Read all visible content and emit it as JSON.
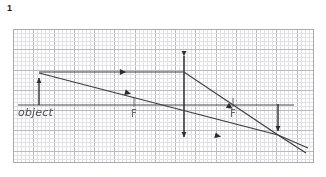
{
  "page": {
    "question_number": "1",
    "background_color": "#ffffff"
  },
  "grid": {
    "minor_cell_px": 4.05,
    "major_every": 5,
    "minor_color": "#e2e2e6",
    "major_color": "#b9b9bf",
    "border_color": "#a9a9b0",
    "origin_x": 13,
    "origin_y": 29,
    "width": 301,
    "height": 134
  },
  "labels": {
    "object": "object",
    "focal_left": "F",
    "focal_right": "F"
  },
  "diagram": {
    "type": "converging-lens-ray-diagram",
    "stroke_color": "#3c3c3c",
    "axis_color": "#4a4a4a",
    "principal_axis": {
      "x1": 18,
      "y1": 105,
      "x2": 294,
      "y2": 105
    },
    "lens": {
      "x": 184,
      "y_top": 51,
      "y_bottom": 142
    },
    "object_arrow": {
      "x": 39,
      "y_base": 105,
      "y_tip": 73
    },
    "image_arrow": {
      "x": 278,
      "y_base": 104,
      "y_tip": 135
    },
    "focal_point_left": {
      "x": 134,
      "y": 105
    },
    "focal_point_right": {
      "x": 233,
      "y": 105
    },
    "rays": [
      {
        "name": "parallel-ray",
        "points": [
          [
            39,
            72
          ],
          [
            184,
            72
          ],
          [
            278,
            135
          ],
          [
            306,
            153
          ]
        ],
        "arrow_positions": [
          [
            123,
            72
          ],
          [
            230,
            107
          ]
        ]
      },
      {
        "name": "center-ray",
        "points": [
          [
            39,
            73
          ],
          [
            278,
            135
          ],
          [
            308,
            148
          ]
        ],
        "arrow_positions": [
          [
            128,
            93
          ],
          [
            218,
            136
          ]
        ]
      }
    ]
  }
}
